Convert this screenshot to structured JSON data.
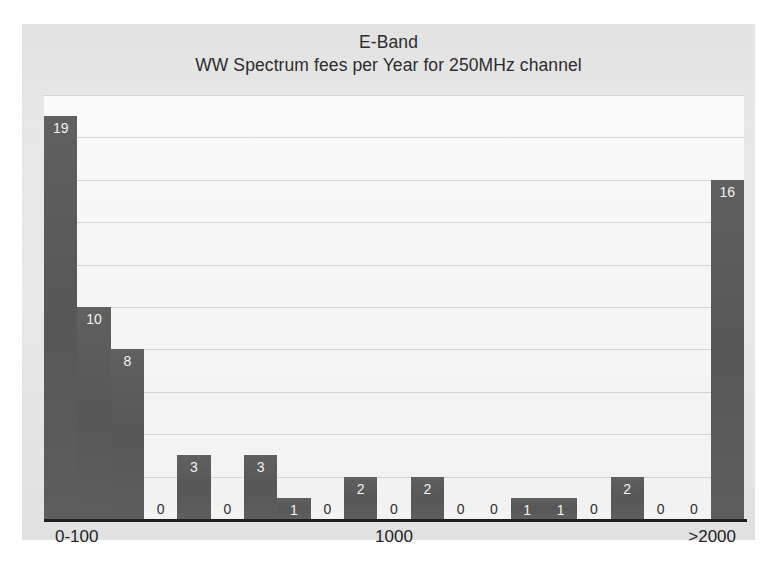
{
  "chart_data": {
    "type": "bar",
    "title": "E-Band",
    "subtitle": "WW Spectrum fees per Year for 250MHz channel",
    "xlabel": "",
    "ylabel": "",
    "ylim": [
      0,
      20
    ],
    "grid": true,
    "grid_step": 2,
    "legend": null,
    "bar_color": "#5b5b5b",
    "value_label_color": "#f2f2f2",
    "zero_label_color": "#2f2f2f",
    "plot_background": "#f6f6f6",
    "page_background": "#ececed",
    "axis_color": "#1d1d1d",
    "gridline_color": "#cfcfcf",
    "categories": [
      "1",
      "2",
      "3",
      "4",
      "5",
      "6",
      "7",
      "8",
      "9",
      "10",
      "11",
      "12",
      "13",
      "14",
      "15",
      "16",
      "17",
      "18",
      "19",
      "20",
      "21"
    ],
    "values": [
      19,
      10,
      8,
      0,
      3,
      0,
      3,
      1,
      0,
      2,
      0,
      2,
      0,
      0,
      1,
      1,
      0,
      2,
      0,
      0,
      16
    ],
    "value_labels": [
      "19",
      "10",
      "8",
      "0",
      "3",
      "0",
      "3",
      "1",
      "0",
      "2",
      "0",
      "2",
      "0",
      "0",
      "1",
      "1",
      "0",
      "2",
      "0",
      "0",
      "16"
    ],
    "xtick_labels": [
      "0-100",
      "1000",
      ">2000"
    ],
    "xtick_positions": [
      "start",
      "mid",
      "end"
    ],
    "gridline_values": [
      2,
      4,
      6,
      8,
      10,
      12,
      14,
      16,
      18,
      20
    ]
  },
  "chart": {
    "title": "E-Band",
    "subtitle": "WW Spectrum fees per Year for 250MHz channel",
    "x_axis": {
      "start_label": "0-100",
      "mid_label": "1000",
      "end_label": ">2000"
    }
  }
}
